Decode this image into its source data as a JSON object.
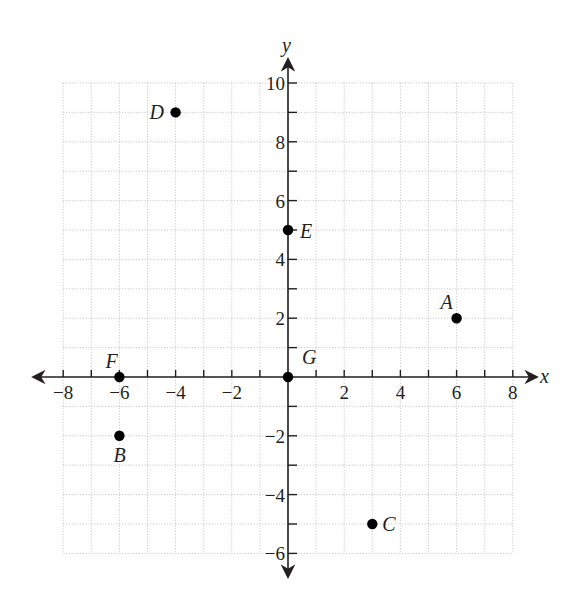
{
  "chart_data": {
    "type": "scatter",
    "title": "",
    "xlabel": "x",
    "ylabel": "y",
    "xlim": [
      -8,
      8
    ],
    "ylim": [
      -6,
      10
    ],
    "grid": true,
    "x_ticks": [
      -8,
      -6,
      -4,
      -2,
      2,
      4,
      6,
      8
    ],
    "y_ticks": [
      10,
      8,
      6,
      4,
      2,
      -2,
      -4,
      -6
    ],
    "points": [
      {
        "label": "A",
        "x": 6,
        "y": 2
      },
      {
        "label": "B",
        "x": -6,
        "y": -2
      },
      {
        "label": "C",
        "x": 3,
        "y": -5
      },
      {
        "label": "D",
        "x": -4,
        "y": 9
      },
      {
        "label": "E",
        "x": 0,
        "y": 5
      },
      {
        "label": "F",
        "x": -6,
        "y": 0
      },
      {
        "label": "G",
        "x": 0,
        "y": 0
      }
    ]
  },
  "axes": {
    "x_title": "x",
    "y_title": "y"
  },
  "colors": {
    "ink": "#231f20",
    "grid": "#bdbdbd",
    "point": "#000000"
  }
}
